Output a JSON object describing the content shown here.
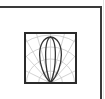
{
  "frame": {
    "border_color": "#3a3a3a",
    "faint_line_color": "#e4e4e4"
  },
  "icon": {
    "name": "polar-light-distribution-icon",
    "border_color": "#2b2b2b",
    "grid_color": "#c8c8c8",
    "curve_color": "#333333"
  }
}
